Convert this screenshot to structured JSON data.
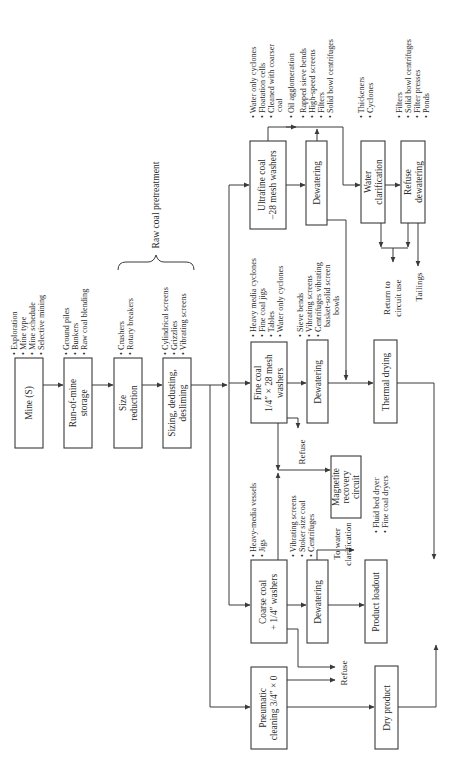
{
  "diagram": {
    "orientation": "rotated-90-ccw",
    "group_label": "Raw coal pretreatment",
    "nodes": {
      "mine": {
        "lines": [
          "Mine (S)"
        ],
        "bullets": [
          "Exploration",
          "Mine type",
          "Mine schedule",
          "Selective mining"
        ]
      },
      "rom": {
        "lines": [
          "Run-of-mine",
          "storage"
        ],
        "bullets": [
          "Ground piles",
          "Bunkers",
          "Raw coal blending"
        ]
      },
      "size_reduction": {
        "lines": [
          "Size",
          "reduction"
        ],
        "bullets": [
          "Crushers",
          "Rotary breakers"
        ]
      },
      "sizing": {
        "lines": [
          "Sizing, dedusting,",
          "desliming"
        ],
        "bullets": [
          "Cylindrical screens",
          "Grizzlies",
          "Vibrating screens"
        ]
      },
      "ultrafine": {
        "lines": [
          "Ultrafine coal",
          "−28 mesh washers"
        ],
        "bullets": [
          "Water only cyclones",
          "Floatation cells",
          "Cleaned with coarser",
          "  coal",
          "Oil agglomeration"
        ]
      },
      "ultrafine_dewatering": {
        "lines": [
          "Dewatering"
        ],
        "bullets": [
          "Rapped sieve bends",
          "High-speed screens",
          "Filters",
          "Solid bowl centrifuges"
        ]
      },
      "water_clarification": {
        "lines": [
          "Water",
          "clarification"
        ],
        "bullets": [
          "Thickeners",
          "Cyclones"
        ]
      },
      "refuse_dewatering": {
        "lines": [
          "Refuse",
          "dewatering"
        ],
        "bullets": [
          "Filters",
          "Solid bowl centrifuges",
          "Filter presses",
          "Ponds"
        ]
      },
      "fine": {
        "lines": [
          "Fine coal",
          "1/4″ × 28 mesh",
          "washers"
        ],
        "bullets": [
          "Heavy media cyclones",
          "Fine coal jigs",
          "Tables",
          "Water only cyclones"
        ]
      },
      "fine_dewatering": {
        "lines": [
          "Dewatering"
        ],
        "bullets": [
          "Sieve bends",
          "Vibrating screens",
          "Centrifuges vibrating",
          "  basket-solid screen",
          "  bowls"
        ]
      },
      "thermal": {
        "lines": [
          "Thermal drying"
        ],
        "bullets": [
          "Fluid bed dryer",
          "Fine coal dryers"
        ]
      },
      "magnetite": {
        "lines": [
          "Magnetite",
          "recovery",
          "circuit"
        ],
        "bullets": []
      },
      "coarse": {
        "lines": [
          "Coarse coal",
          "+ 1/4″ washers"
        ],
        "bullets": [
          "Heavy-media vessels",
          "Jigs"
        ]
      },
      "coarse_dewatering": {
        "lines": [
          "Dewatering"
        ],
        "bullets": [
          "Vibrating screens",
          "Stoker size coal",
          "Centrifuges"
        ]
      },
      "product_loadout": {
        "lines": [
          "Product loadout"
        ],
        "bullets": []
      },
      "pneumatic": {
        "lines": [
          "Pneumatic",
          "cleaning 3/4″ × 0"
        ],
        "bullets": []
      },
      "dry_product": {
        "lines": [
          "Dry product"
        ],
        "bullets": []
      }
    },
    "annotations": {
      "refuse_fine": "Refuse",
      "refuse_coarse": "Refuse",
      "to_water_clarification": [
        "To water",
        "clarification"
      ],
      "return_to_circuit": [
        "Return to",
        "circuit use"
      ],
      "tailings": "Tailings"
    }
  }
}
